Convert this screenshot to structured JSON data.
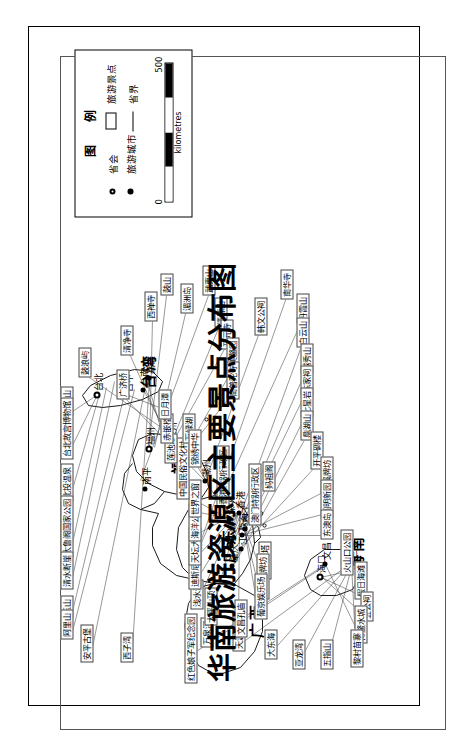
{
  "map": {
    "title": "华南旅游资源区主要景点分布图",
    "region": "华南旅游资源区",
    "legend": {
      "title": "图 例",
      "items": [
        {
          "symbol": "capital-dot-icon",
          "label": "省会"
        },
        {
          "symbol": "city-dot-icon",
          "label": "旅游城市"
        },
        {
          "symbol": "attraction-box-icon",
          "label": "旅游景点"
        },
        {
          "symbol": "boundary-line-icon",
          "label": "省界"
        }
      ],
      "scale": {
        "min": "0",
        "max": "500",
        "units": "kilometres"
      }
    },
    "provinces": [
      {
        "name": "福建",
        "x": 222,
        "y": 118
      },
      {
        "name": "广东",
        "x": 133,
        "y": 168
      },
      {
        "name": "广西",
        "x": 58,
        "y": 196
      },
      {
        "name": "台湾",
        "x": 307,
        "y": 88
      },
      {
        "name": "海南",
        "x": 126,
        "y": 296
      }
    ],
    "cities": [
      {
        "name": "福州",
        "type": "capital",
        "x": 246,
        "y": 100
      },
      {
        "name": "南平",
        "type": "city",
        "x": 206,
        "y": 96
      },
      {
        "name": "泉州",
        "type": "city",
        "x": 251,
        "y": 122
      },
      {
        "name": "厦门",
        "type": "city",
        "x": 246,
        "y": 139
      },
      {
        "name": "潮州",
        "type": "city",
        "x": 214,
        "y": 156
      },
      {
        "name": "韶关",
        "type": "city",
        "x": 141,
        "y": 147
      },
      {
        "name": "广州",
        "type": "capital",
        "x": 150,
        "y": 181
      },
      {
        "name": "深圳",
        "type": "city",
        "x": 176,
        "y": 180
      },
      {
        "name": "香港",
        "type": "city",
        "x": 182,
        "y": 190
      },
      {
        "name": "珠海",
        "type": "city",
        "x": 160,
        "y": 193
      },
      {
        "name": "澳门",
        "type": "city",
        "x": 166,
        "y": 196
      },
      {
        "name": "江门",
        "type": "city",
        "x": 146,
        "y": 192
      },
      {
        "name": "肇庆",
        "type": "city",
        "x": 129,
        "y": 183
      },
      {
        "name": "海口",
        "type": "capital",
        "x": 118,
        "y": 271
      },
      {
        "name": "文昌",
        "type": "city",
        "x": 131,
        "y": 276
      },
      {
        "name": "三亚",
        "type": "city",
        "x": 132,
        "y": 303
      },
      {
        "name": "台北",
        "type": "capital",
        "x": 300,
        "y": 48
      },
      {
        "name": "台中",
        "type": "city",
        "x": 299,
        "y": 78
      },
      {
        "name": "台南",
        "type": "city",
        "x": 305,
        "y": 94
      },
      {
        "name": "高雄",
        "type": "city",
        "x": 317,
        "y": 100
      }
    ],
    "attractions": [
      {
        "label": "阳明山",
        "x": 279,
        "y": 12
      },
      {
        "label": "台北故宫博物馆",
        "x": 236,
        "y": 12
      },
      {
        "label": "北投温泉",
        "x": 194,
        "y": 12
      },
      {
        "label": "太鲁阁国家公园",
        "x": 138,
        "y": 12
      },
      {
        "label": "清水断崖",
        "x": 106,
        "y": 12
      },
      {
        "label": "玉山",
        "x": 78,
        "y": 12
      },
      {
        "label": "阿里山",
        "x": 56,
        "y": 12
      },
      {
        "label": "安平古堡",
        "x": 33,
        "y": 32
      },
      {
        "label": "西子湾",
        "x": 33,
        "y": 72
      },
      {
        "label": "鼓浪屿",
        "x": 318,
        "y": 30
      },
      {
        "label": "清净寺",
        "x": 340,
        "y": 72
      },
      {
        "label": "西禅寺",
        "x": 374,
        "y": 96
      },
      {
        "label": "鼓山",
        "x": 400,
        "y": 112
      },
      {
        "label": "湄洲岛",
        "x": 382,
        "y": 132
      },
      {
        "label": "武夷山",
        "x": 400,
        "y": 154
      },
      {
        "label": "清源山",
        "x": 368,
        "y": 166
      },
      {
        "label": "开元寺",
        "x": 346,
        "y": 172
      },
      {
        "label": "集美鳌园",
        "x": 320,
        "y": 178
      },
      {
        "label": "南普陀寺",
        "x": 296,
        "y": 178
      },
      {
        "label": "韩文公祠",
        "x": 360,
        "y": 206
      },
      {
        "label": "南华寺",
        "x": 396,
        "y": 232
      },
      {
        "label": "丹霞山",
        "x": 372,
        "y": 248
      },
      {
        "label": "白云山",
        "x": 348,
        "y": 248
      },
      {
        "label": "越秀山",
        "x": 322,
        "y": 252
      },
      {
        "label": "陈家祠",
        "x": 300,
        "y": 252
      },
      {
        "label": "七星岩",
        "x": 278,
        "y": 252
      },
      {
        "label": "鼎湖山",
        "x": 255,
        "y": 252
      },
      {
        "label": "开平碉楼",
        "x": 226,
        "y": 262
      },
      {
        "label": "梅溪牌坊",
        "x": 201,
        "y": 272
      },
      {
        "label": "圆明新园",
        "x": 178,
        "y": 272
      },
      {
        "label": "东澳岛",
        "x": 156,
        "y": 272
      },
      {
        "label": "火山口公园",
        "x": 120,
        "y": 292
      },
      {
        "label": "假日海滩",
        "x": 96,
        "y": 306
      },
      {
        "label": "五公祠",
        "x": 74,
        "y": 312
      },
      {
        "label": "博鳌水城",
        "x": 52,
        "y": 306
      },
      {
        "label": "黎村苗寨",
        "x": 28,
        "y": 302
      },
      {
        "label": "五指山",
        "x": 26,
        "y": 272
      },
      {
        "label": "亚龙湾",
        "x": 26,
        "y": 244
      },
      {
        "label": "大东海",
        "x": 36,
        "y": 216
      },
      {
        "label": "天涯海角",
        "x": 44,
        "y": 184
      },
      {
        "label": "万泉河",
        "x": 48,
        "y": 152
      },
      {
        "label": "红色娘子军纪念园",
        "x": 12,
        "y": 136
      },
      {
        "label": "妈祖阁",
        "x": 204,
        "y": 214
      },
      {
        "label": "松山灯塔",
        "x": 116,
        "y": 210
      },
      {
        "label": "大三巴牌坊",
        "x": 96,
        "y": 208
      },
      {
        "label": "葡京娱乐场",
        "x": 76,
        "y": 206
      },
      {
        "label": "文昌孔庙",
        "x": 58,
        "y": 186
      },
      {
        "label": "太平山顶",
        "x": 70,
        "y": 156
      },
      {
        "label": "浅水湾",
        "x": 86,
        "y": 142
      },
      {
        "label": "迪斯尼乐园",
        "x": 106,
        "y": 140
      },
      {
        "label": "天坛大佛",
        "x": 130,
        "y": 140
      },
      {
        "label": "海洋公园",
        "x": 154,
        "y": 140
      },
      {
        "label": "世界之窗",
        "x": 178,
        "y": 140
      },
      {
        "label": "中国民俗文化村",
        "x": 196,
        "y": 128
      },
      {
        "label": "莲池潭",
        "x": 232,
        "y": 116
      },
      {
        "label": "赤嵌楼",
        "x": 252,
        "y": 112
      },
      {
        "label": "日月潭",
        "x": 276,
        "y": 110
      },
      {
        "label": "万绿湖",
        "x": 252,
        "y": 134
      },
      {
        "label": "锦绣中华",
        "x": 228,
        "y": 140
      },
      {
        "label": "香港特别行政区",
        "x": 188,
        "y": 168
      },
      {
        "label": "澳门特别行政区",
        "x": 170,
        "y": 200
      },
      {
        "label": "广济桥",
        "x": 296,
        "y": 68
      }
    ]
  }
}
